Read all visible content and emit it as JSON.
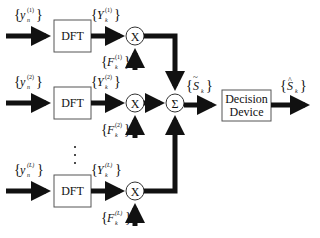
{
  "diagram": {
    "type": "block-diagram",
    "branches": [
      {
        "input_label": "y_n^(1)",
        "block_label": "DFT",
        "output_label": "Y_k^(1)",
        "weight_label": "F_k^(1)",
        "multiplier_symbol": "X"
      },
      {
        "input_label": "y_n^(2)",
        "block_label": "DFT",
        "output_label": "Y_k^(2)",
        "weight_label": "F_k^(2)",
        "multiplier_symbol": "X"
      },
      {
        "input_label": "y_n^(L)",
        "block_label": "DFT",
        "output_label": "Y_k^(L)",
        "weight_label": "F_k^(L)",
        "multiplier_symbol": "X"
      }
    ],
    "ellipsis": "⋮",
    "summer": {
      "symbol": "Σ",
      "output_label": "S̃_k"
    },
    "decision": {
      "line1": "Decision",
      "line2": "Device",
      "output_label": "Ŝ_k"
    }
  },
  "text": {
    "dft": "DFT",
    "x": "X",
    "sigma": "Σ",
    "decision1": "Decision",
    "decision2": "Device",
    "y": "y",
    "Y": "Y",
    "F": "F",
    "S": "S",
    "n": "n",
    "k": "k",
    "sup1": "(1)",
    "sup2": "(2)",
    "supL": "(L)",
    "lbrace": "{",
    "rbrace": "}",
    "tilde": "~",
    "hat": "^"
  }
}
